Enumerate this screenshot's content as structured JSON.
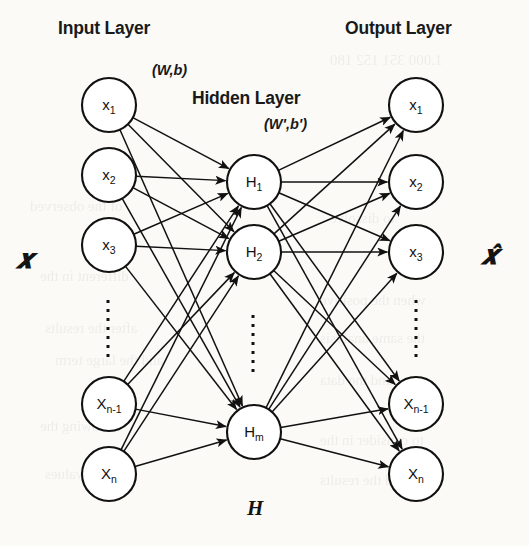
{
  "figure": {
    "type": "neural-network-diagram",
    "background_color": "#fbfaf7",
    "stroke_color": "#111111"
  },
  "titles": {
    "input_layer": "Input Layer",
    "hidden_layer": "Hidden Layer",
    "output_layer": "Output Layer"
  },
  "weights": {
    "encoder": "(W,b)",
    "decoder": "(W',b')"
  },
  "vectors": {
    "input": "𝒙",
    "output": "𝒙̂",
    "hidden": "H"
  },
  "layers": {
    "input": {
      "name": "input-layer",
      "cx": 109,
      "r": 27,
      "nodes": [
        {
          "id": "in-x1",
          "base": "x",
          "sub": "1",
          "cy": 105
        },
        {
          "id": "in-x2",
          "base": "x",
          "sub": "2",
          "cy": 175
        },
        {
          "id": "in-x3",
          "base": "x",
          "sub": "3",
          "cy": 245
        },
        {
          "id": "in-xn1",
          "base": "X",
          "sub": "n-1",
          "cy": 404
        },
        {
          "id": "in-xn",
          "base": "X",
          "sub": "n",
          "cy": 474
        }
      ],
      "ellipsis": {
        "x": 108,
        "y1": 300,
        "y2": 362
      }
    },
    "hidden": {
      "name": "hidden-layer",
      "cx": 254,
      "r": 27,
      "nodes": [
        {
          "id": "h-h1",
          "base": "H",
          "sub": "1",
          "cy": 182
        },
        {
          "id": "h-h2",
          "base": "H",
          "sub": "2",
          "cy": 252
        },
        {
          "id": "h-hm",
          "base": "H",
          "sub": "m",
          "cy": 432
        }
      ],
      "ellipsis": {
        "x": 253,
        "y1": 315,
        "y2": 375
      }
    },
    "output": {
      "name": "output-layer",
      "cx": 416,
      "r": 27,
      "nodes": [
        {
          "id": "out-x1",
          "base": "x",
          "sub": "1",
          "cy": 105
        },
        {
          "id": "out-x2",
          "base": "x",
          "sub": "2",
          "cy": 182
        },
        {
          "id": "out-x3",
          "base": "x",
          "sub": "3",
          "cy": 252
        },
        {
          "id": "out-xn1",
          "base": "X",
          "sub": "n-1",
          "cy": 404
        },
        {
          "id": "out-xn",
          "base": "X",
          "sub": "n",
          "cy": 474
        }
      ],
      "ellipsis": {
        "x": 416,
        "y1": 300,
        "y2": 362
      }
    }
  },
  "bleed_text": [
    {
      "t": "1.000   351   152   180",
      "x": 330,
      "y": 52
    },
    {
      "t": "of the observed",
      "x": 30,
      "y": 198
    },
    {
      "t": "to dissolve",
      "x": 330,
      "y": 210
    },
    {
      "t": "different in the",
      "x": 40,
      "y": 268
    },
    {
      "t": "when the positive",
      "x": 320,
      "y": 292
    },
    {
      "t": "after the results",
      "x": 45,
      "y": 320
    },
    {
      "t": "the same analysis",
      "x": 320,
      "y": 330
    },
    {
      "t": "and the large term",
      "x": 55,
      "y": 352
    },
    {
      "t": "and the data",
      "x": 320,
      "y": 372
    },
    {
      "t": "following the",
      "x": 40,
      "y": 418
    },
    {
      "t": "to consider in the",
      "x": 320,
      "y": 432
    },
    {
      "t": "several values",
      "x": 45,
      "y": 466
    },
    {
      "t": "and the results",
      "x": 320,
      "y": 472
    }
  ]
}
